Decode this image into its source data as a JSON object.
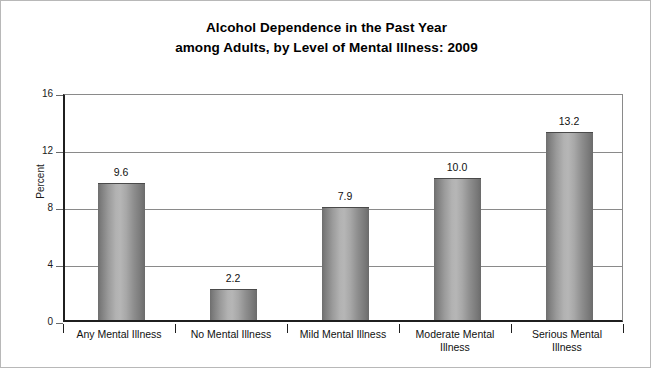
{
  "chart_data": {
    "type": "bar",
    "title": "Alcohol Dependence in the Past Year among Adults, by Level of Mental Illness: 2009",
    "title_lines": [
      "Alcohol Dependence in the Past Year",
      "among Adults, by Level of Mental Illness: 2009"
    ],
    "categories": [
      "Any Mental Illness",
      "No Mental Illness",
      "Mild Mental Illness",
      "Moderate Mental Illness",
      "Serious Mental Illness"
    ],
    "category_lines": [
      [
        "Any Mental Illness"
      ],
      [
        "No Mental Illness"
      ],
      [
        "Mild Mental Illness"
      ],
      [
        "Moderate Mental",
        "Illness"
      ],
      [
        "Serious Mental",
        "Illness"
      ]
    ],
    "values": [
      9.6,
      2.2,
      7.9,
      10.0,
      13.2
    ],
    "value_labels": [
      "9.6",
      "2.2",
      "7.9",
      "10.0",
      "13.2"
    ],
    "xlabel": "",
    "ylabel": "Percent",
    "ylim": [
      0,
      16
    ],
    "yticks": [
      0,
      4,
      8,
      12,
      16
    ],
    "ytick_labels": [
      "0",
      "4",
      "8",
      "12",
      "16"
    ],
    "grid": true,
    "grid_axis": "y",
    "legend": false,
    "bar_color": "#9a9a9a",
    "bar_style": "cylinder-gradient",
    "axis_color": "#1f1f1f",
    "grid_color": "#8a8a8a",
    "text_color": "#111111",
    "background": "#ffffff"
  }
}
